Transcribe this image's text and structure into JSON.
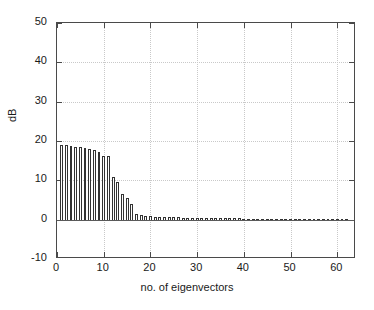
{
  "figure": {
    "background": "#ffffff",
    "axis_color": "#4a4a4a",
    "grid_color": "#c9c9c9",
    "bar_edge_color": "#333333",
    "bar_face_color": "#ffffff"
  },
  "axes": {
    "y_title": "dB",
    "x_title": "no. of eigenvectors",
    "y_ticklabels": [
      "50",
      "40",
      "30",
      "20",
      "10",
      "0",
      "-10"
    ],
    "x_ticklabels": [
      "0",
      "10",
      "20",
      "30",
      "40",
      "50",
      "60"
    ]
  },
  "chart_data": {
    "type": "bar",
    "title": "",
    "subtitle": "",
    "xlabel": "no. of eigenvectors",
    "ylabel": "dB",
    "xlim": [
      0,
      64
    ],
    "ylim": [
      -10,
      50
    ],
    "xticks": [
      0,
      10,
      20,
      30,
      40,
      50,
      60
    ],
    "yticks": [
      -10,
      0,
      10,
      20,
      30,
      40,
      50
    ],
    "grid": true,
    "legend": null,
    "legend_position": "none",
    "series": [
      {
        "name": "eigenvalue spectrum",
        "x": [
          1,
          2,
          3,
          4,
          5,
          6,
          7,
          8,
          9,
          10,
          11,
          12,
          13,
          14,
          15,
          16,
          17,
          18,
          19,
          20,
          21,
          22,
          23,
          24,
          25,
          26,
          27,
          28,
          29,
          30,
          31,
          32,
          33,
          34,
          35,
          36,
          37,
          38,
          39,
          40,
          41,
          42,
          43,
          44,
          45,
          46,
          47,
          48,
          49,
          50,
          51,
          52,
          53,
          54,
          55,
          56,
          57,
          58,
          59,
          60,
          61,
          62,
          63,
          64
        ],
        "values": [
          19.0,
          19.0,
          18.7,
          18.6,
          18.4,
          18.3,
          17.9,
          17.6,
          17.2,
          16.3,
          16.3,
          10.8,
          9.5,
          6.5,
          5.5,
          4.0,
          1.5,
          1.2,
          1.0,
          0.9,
          0.8,
          0.75,
          0.7,
          0.65,
          0.6,
          0.58,
          0.55,
          0.52,
          0.5,
          0.48,
          0.46,
          0.44,
          0.42,
          0.4,
          0.38,
          0.36,
          0.34,
          0.32,
          0.3,
          0.28,
          0.27,
          0.26,
          0.25,
          0.24,
          0.23,
          0.22,
          0.21,
          0.2,
          0.19,
          0.18,
          0.17,
          0.16,
          0.15,
          0.14,
          0.13,
          0.12,
          0.11,
          0.1,
          0.09,
          0.08,
          0.07,
          0.06,
          0.04,
          -0.3
        ]
      }
    ]
  }
}
